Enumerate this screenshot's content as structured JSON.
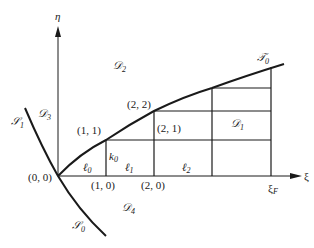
{
  "diagram": {
    "axes": {
      "horizontal": "ξ",
      "vertical": "η",
      "xi_end_label": "ξ",
      "xi_end_sub": "F"
    },
    "points": [
      {
        "label": "(0, 0)"
      },
      {
        "label": "(1, 0)"
      },
      {
        "label": "(2, 0)"
      },
      {
        "label": "(1, 1)"
      },
      {
        "label": "(2, 1)"
      },
      {
        "label": "(2, 2)"
      }
    ],
    "curves": {
      "s1": {
        "main": "𝒮",
        "sub": "1"
      },
      "s0": {
        "main": "𝒮",
        "sub": "0"
      },
      "t0": {
        "main": "𝒯",
        "sub": "0"
      }
    },
    "regions": {
      "d1": {
        "main": "𝒟",
        "sub": "1"
      },
      "d2": {
        "main": "𝒟",
        "sub": "2"
      },
      "d3": {
        "main": "𝒟",
        "sub": "3"
      },
      "d4": {
        "main": "𝒟",
        "sub": "4"
      }
    },
    "segments": {
      "l0": {
        "main": "ℓ",
        "sub": "0"
      },
      "l1": {
        "main": "ℓ",
        "sub": "1"
      },
      "l2": {
        "main": "ℓ",
        "sub": "2"
      },
      "k0": {
        "main": "k",
        "sub": "0"
      }
    },
    "colors": {
      "line": "#1a1a1a",
      "background": "#ffffff"
    }
  }
}
